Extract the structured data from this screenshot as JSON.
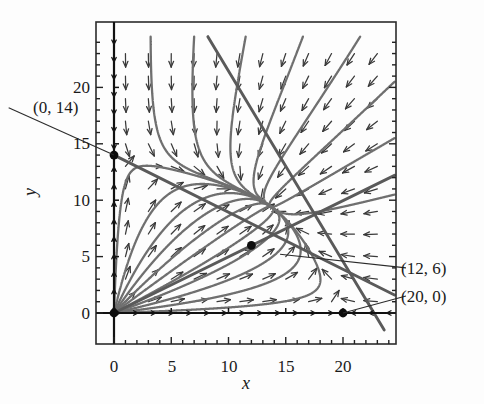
{
  "figure": {
    "title": "",
    "background": "#fdfdfd",
    "frame_color": "#2b2b2b",
    "axis_color": "#111111",
    "trajectory_color": "#6f6f6f",
    "separatrix_color": "#5a5a5a",
    "arrow_color": "#3a3a3a",
    "dot_color": "#0d0d0d",
    "leader_color": "#2b2b2b"
  },
  "chart_data": {
    "type": "scatter",
    "title": "",
    "xlabel": "x",
    "ylabel": "y",
    "xlim": [
      -1.5,
      24.5
    ],
    "ylim": [
      -1.5,
      24.5
    ],
    "grid": false,
    "legend": "none",
    "xticks": [
      0,
      5,
      10,
      15,
      20
    ],
    "yticks": [
      0,
      5,
      10,
      15,
      20
    ],
    "xtick_labels": [
      "0",
      "5",
      "10",
      "15",
      "20"
    ],
    "ytick_labels": [
      "0",
      "5",
      "10",
      "15",
      "20"
    ],
    "minor_tick_step": 1,
    "equilibria": [
      {
        "label": "(0, 14)",
        "x": 0,
        "y": 14
      },
      {
        "label": "(12, 6)",
        "x": 12,
        "y": 6
      },
      {
        "label": "(20, 0)",
        "x": 20,
        "y": 0
      },
      {
        "label": "",
        "x": 0,
        "y": 0
      }
    ],
    "annotations": [
      {
        "text": "(0, 14)",
        "x": 0,
        "y": 14,
        "label_x": -9.2,
        "label_y": 18.2
      },
      {
        "text": "(12, 6)",
        "x": 14.5,
        "y": 5.2,
        "label_x": 25.5,
        "label_y": 4.0
      },
      {
        "text": "(20, 0)",
        "x": 20,
        "y": 0,
        "label_x": 25.5,
        "label_y": 1.5
      }
    ],
    "nullclines": [
      {
        "name": "nullcline-a",
        "from": [
          0,
          14
        ],
        "to": [
          24.5,
          1.6
        ]
      },
      {
        "name": "nullcline-b",
        "from": [
          0,
          0
        ],
        "to": [
          24.5,
          12.2
        ]
      },
      {
        "name": "nullcline-c",
        "from": [
          8.2,
          24.5
        ],
        "to": [
          23.6,
          -1.5
        ]
      }
    ],
    "direction_field": {
      "step": 2,
      "x_start": 1,
      "y_start": 1,
      "description": "arrows point toward the saddle structure; downward above the upper nullcline, leftward to the right, rightward near the lower-left wedge"
    },
    "trajectory_fan_origin": [
      0,
      0
    ],
    "trajectory_angles_deg": [
      2,
      7,
      13,
      20,
      28,
      37,
      46,
      56,
      66,
      77,
      88
    ],
    "incoming_trajectories": [
      {
        "entry": [
          3.2,
          24.5
        ]
      },
      {
        "entry": [
          7.0,
          24.5
        ]
      },
      {
        "entry": [
          11.5,
          24.5
        ]
      },
      {
        "entry": [
          16.5,
          24.5
        ]
      },
      {
        "entry": [
          21.5,
          24.5
        ]
      },
      {
        "entry": [
          24.5,
          20.5
        ]
      },
      {
        "entry": [
          24.5,
          15.5
        ]
      },
      {
        "entry": [
          24.5,
          10.5
        ]
      }
    ]
  }
}
